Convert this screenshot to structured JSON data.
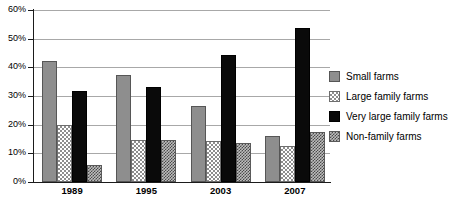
{
  "chart_data": {
    "type": "bar",
    "title": "",
    "subtitle": "",
    "xlabel": "",
    "ylabel": "",
    "categories": [
      "1989",
      "1995",
      "2003",
      "2007"
    ],
    "series": [
      {
        "name": "Small farms",
        "values": [
          42.2,
          37.4,
          26.6,
          15.9
        ],
        "style": "solid-gray"
      },
      {
        "name": "Large family farms",
        "values": [
          19.9,
          14.7,
          14.3,
          12.4
        ],
        "style": "light-checker"
      },
      {
        "name": "Very large family farms",
        "values": [
          31.6,
          33.0,
          44.3,
          53.7
        ],
        "style": "solid-black"
      },
      {
        "name": "Non-family farms",
        "values": [
          6.0,
          14.5,
          13.6,
          17.3
        ],
        "style": "dark-checker"
      }
    ],
    "ylim": [
      0,
      60
    ],
    "ytick_step": 10,
    "ytick_labels": [
      "0%",
      "10%",
      "20%",
      "30%",
      "40%",
      "50%",
      "60%"
    ],
    "ytick_values": [
      0,
      10,
      20,
      30,
      40,
      50,
      60
    ],
    "grid": true,
    "grid_axis": "y",
    "legend_position": "right",
    "value_unit": "percent",
    "colors": {
      "small_farms": "#8e8e8e",
      "large_family_farms": "#ffffff",
      "very_large_family_farms": "#0a0a0a",
      "non_family_farms": "#4a4a4a",
      "grid": "#a8a8a8",
      "axis": "#1b1b1b",
      "background": "#ffffff"
    }
  }
}
